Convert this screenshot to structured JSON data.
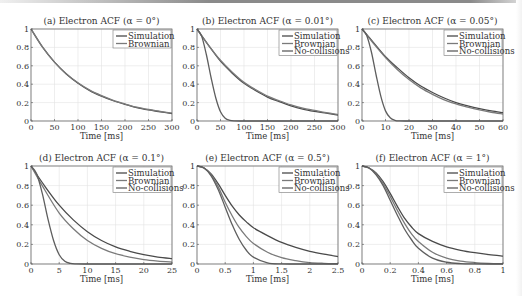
{
  "chart_data": [
    {
      "type": "line",
      "title": "(a) Electron ACF (α = 0°)",
      "xlabel": "Time [ms]",
      "ylabel": "",
      "xlim": [
        0,
        300
      ],
      "ylim": [
        0,
        1
      ],
      "xticks": [
        0,
        50,
        100,
        150,
        200,
        250,
        300
      ],
      "yticks": [
        0,
        0.2,
        0.4,
        0.6,
        0.8,
        1
      ],
      "grid": true,
      "legend_position": "upper right",
      "series": [
        {
          "name": "Simulation",
          "x": [
            0,
            25,
            50,
            75,
            100,
            125,
            150,
            175,
            200,
            225,
            250,
            275,
            300
          ],
          "y": [
            1,
            0.8,
            0.64,
            0.51,
            0.41,
            0.33,
            0.27,
            0.22,
            0.18,
            0.145,
            0.12,
            0.1,
            0.08
          ]
        },
        {
          "name": "Brownian",
          "x": [
            0,
            25,
            50,
            75,
            100,
            125,
            150,
            175,
            200,
            225,
            250,
            275,
            300
          ],
          "y": [
            1,
            0.8,
            0.64,
            0.515,
            0.415,
            0.335,
            0.275,
            0.225,
            0.185,
            0.15,
            0.125,
            0.105,
            0.085
          ]
        }
      ]
    },
    {
      "type": "line",
      "title": "(b) Electron ACF (α = 0.01°)",
      "xlabel": "Time [ms]",
      "ylabel": "",
      "xlim": [
        0,
        300
      ],
      "ylim": [
        0,
        1
      ],
      "xticks": [
        0,
        50,
        100,
        150,
        200,
        250,
        300
      ],
      "yticks": [
        0,
        0.2,
        0.4,
        0.6,
        0.8,
        1
      ],
      "grid": true,
      "legend_position": "upper right",
      "series": [
        {
          "name": "Simulation",
          "x": [
            0,
            25,
            50,
            75,
            100,
            125,
            150,
            175,
            200,
            225,
            250,
            275,
            300
          ],
          "y": [
            1,
            0.82,
            0.65,
            0.52,
            0.41,
            0.33,
            0.26,
            0.21,
            0.165,
            0.13,
            0.105,
            0.085,
            0.065
          ]
        },
        {
          "name": "Brownian",
          "x": [
            0,
            25,
            50,
            75,
            100,
            125,
            150,
            175,
            200,
            225,
            250,
            275,
            300
          ],
          "y": [
            1,
            0.82,
            0.66,
            0.53,
            0.42,
            0.34,
            0.27,
            0.22,
            0.175,
            0.14,
            0.115,
            0.09,
            0.07
          ]
        },
        {
          "name": "No-collisions",
          "x": [
            0,
            10,
            20,
            30,
            40,
            50,
            60,
            70,
            80,
            100,
            150,
            200,
            300
          ],
          "y": [
            1,
            0.92,
            0.72,
            0.47,
            0.25,
            0.1,
            0.03,
            0.007,
            0.001,
            0,
            0,
            0,
            0
          ]
        }
      ]
    },
    {
      "type": "line",
      "title": "(c) Electron ACF (α = 0.05°)",
      "xlabel": "Time [ms]",
      "ylabel": "",
      "xlim": [
        0,
        60
      ],
      "ylim": [
        0,
        1
      ],
      "xticks": [
        0,
        10,
        20,
        30,
        40,
        50,
        60
      ],
      "yticks": [
        0,
        0.2,
        0.4,
        0.6,
        0.8,
        1
      ],
      "grid": true,
      "legend_position": "upper right",
      "series": [
        {
          "name": "Simulation",
          "x": [
            0,
            5,
            10,
            15,
            20,
            25,
            30,
            35,
            40,
            45,
            50,
            55,
            60
          ],
          "y": [
            1,
            0.85,
            0.7,
            0.58,
            0.47,
            0.38,
            0.31,
            0.25,
            0.2,
            0.165,
            0.135,
            0.11,
            0.09
          ]
        },
        {
          "name": "Brownian",
          "x": [
            0,
            5,
            10,
            15,
            20,
            25,
            30,
            35,
            40,
            45,
            50,
            55,
            60
          ],
          "y": [
            1,
            0.84,
            0.69,
            0.56,
            0.45,
            0.36,
            0.29,
            0.23,
            0.185,
            0.15,
            0.12,
            0.095,
            0.075
          ]
        },
        {
          "name": "No-collisions",
          "x": [
            0,
            2,
            4,
            6,
            8,
            10,
            12,
            14,
            16,
            20,
            30,
            40,
            60
          ],
          "y": [
            1,
            0.93,
            0.75,
            0.5,
            0.27,
            0.11,
            0.035,
            0.008,
            0.001,
            0,
            0,
            0,
            0
          ]
        }
      ]
    },
    {
      "type": "line",
      "title": "(d) Electron ACF (α = 0.1°)",
      "xlabel": "Time [ms]",
      "ylabel": "",
      "xlim": [
        0,
        25
      ],
      "ylim": [
        0,
        1
      ],
      "xticks": [
        0,
        5,
        10,
        15,
        20,
        25
      ],
      "yticks": [
        0,
        0.2,
        0.4,
        0.6,
        0.8,
        1
      ],
      "grid": true,
      "legend_position": "upper right",
      "series": [
        {
          "name": "Simulation",
          "x": [
            0,
            2.5,
            5,
            7.5,
            10,
            12.5,
            15,
            17.5,
            20,
            22.5,
            25
          ],
          "y": [
            1,
            0.79,
            0.6,
            0.45,
            0.33,
            0.24,
            0.175,
            0.13,
            0.095,
            0.07,
            0.055
          ]
        },
        {
          "name": "Brownian",
          "x": [
            0,
            2.5,
            5,
            7.5,
            10,
            12.5,
            15,
            17.5,
            20,
            22.5,
            25
          ],
          "y": [
            1,
            0.75,
            0.52,
            0.36,
            0.24,
            0.16,
            0.105,
            0.07,
            0.045,
            0.03,
            0.02
          ]
        },
        {
          "name": "No-collisions",
          "x": [
            0,
            1,
            2,
            3,
            4,
            5,
            6,
            7,
            8,
            10,
            15,
            20,
            25
          ],
          "y": [
            1,
            0.92,
            0.72,
            0.46,
            0.24,
            0.095,
            0.028,
            0.006,
            0.001,
            0,
            0,
            0,
            0
          ]
        }
      ]
    },
    {
      "type": "line",
      "title": "(e) Electron ACF (α = 0.5°)",
      "xlabel": "Time [ms]",
      "ylabel": "",
      "xlim": [
        0,
        2.5
      ],
      "ylim": [
        0,
        1
      ],
      "xticks": [
        0,
        0.5,
        1,
        1.5,
        2,
        2.5
      ],
      "yticks": [
        0,
        0.2,
        0.4,
        0.6,
        0.8,
        1
      ],
      "grid": true,
      "legend_position": "upper right",
      "series": [
        {
          "name": "Simulation",
          "x": [
            0,
            0.125,
            0.25,
            0.375,
            0.5,
            0.625,
            0.75,
            0.875,
            1,
            1.25,
            1.5,
            1.75,
            2,
            2.25,
            2.5
          ],
          "y": [
            1,
            0.98,
            0.92,
            0.82,
            0.7,
            0.59,
            0.5,
            0.43,
            0.37,
            0.29,
            0.22,
            0.17,
            0.13,
            0.1,
            0.075
          ]
        },
        {
          "name": "Brownian",
          "x": [
            0,
            0.125,
            0.25,
            0.375,
            0.5,
            0.625,
            0.75,
            0.875,
            1,
            1.25,
            1.5,
            1.75,
            2,
            2.25,
            2.5
          ],
          "y": [
            1,
            0.98,
            0.91,
            0.79,
            0.63,
            0.49,
            0.37,
            0.28,
            0.21,
            0.12,
            0.065,
            0.035,
            0.015,
            0.007,
            0.003
          ]
        },
        {
          "name": "No-collisions",
          "x": [
            0,
            0.125,
            0.25,
            0.375,
            0.5,
            0.625,
            0.75,
            0.875,
            1,
            1.25,
            1.5,
            1.75,
            2,
            2.5
          ],
          "y": [
            1,
            0.98,
            0.9,
            0.76,
            0.58,
            0.4,
            0.25,
            0.14,
            0.07,
            0.012,
            0.001,
            0,
            0,
            0
          ]
        }
      ]
    },
    {
      "type": "line",
      "title": "(f) Electron ACF (α = 1°)",
      "xlabel": "Time [ms]",
      "ylabel": "",
      "xlim": [
        0,
        1
      ],
      "ylim": [
        0,
        1
      ],
      "xticks": [
        0,
        0.2,
        0.4,
        0.6,
        0.8,
        1
      ],
      "yticks": [
        0,
        0.2,
        0.4,
        0.6,
        0.8,
        1
      ],
      "grid": true,
      "legend_position": "upper right",
      "series": [
        {
          "name": "Simulation",
          "x": [
            0,
            0.05,
            0.1,
            0.15,
            0.2,
            0.25,
            0.3,
            0.35,
            0.4,
            0.5,
            0.6,
            0.7,
            0.8,
            0.9,
            1
          ],
          "y": [
            1,
            0.98,
            0.93,
            0.84,
            0.72,
            0.59,
            0.47,
            0.38,
            0.31,
            0.23,
            0.175,
            0.14,
            0.115,
            0.095,
            0.08
          ]
        },
        {
          "name": "Brownian",
          "x": [
            0,
            0.05,
            0.1,
            0.15,
            0.2,
            0.25,
            0.3,
            0.35,
            0.4,
            0.5,
            0.6,
            0.7,
            0.8,
            0.9,
            1
          ],
          "y": [
            1,
            0.98,
            0.92,
            0.82,
            0.69,
            0.55,
            0.42,
            0.31,
            0.23,
            0.12,
            0.06,
            0.03,
            0.015,
            0.007,
            0.003
          ]
        },
        {
          "name": "No-collisions",
          "x": [
            0,
            0.05,
            0.1,
            0.15,
            0.2,
            0.25,
            0.3,
            0.35,
            0.4,
            0.5,
            0.6,
            0.7,
            0.8,
            0.9,
            1
          ],
          "y": [
            1,
            0.98,
            0.91,
            0.8,
            0.65,
            0.5,
            0.36,
            0.25,
            0.16,
            0.06,
            0.018,
            0.004,
            0.001,
            0,
            0
          ]
        }
      ]
    }
  ],
  "colors": {
    "Simulation": "#4a4a4a",
    "Brownian": "#7a7a7a",
    "No-collisions": "#5e5e5e",
    "grid": "#e2e2e2",
    "axes": "#555555"
  },
  "layout": {
    "panels": [
      {
        "left": 31,
        "top": 29,
        "width": 141,
        "height": 92
      },
      {
        "left": 197,
        "top": 29,
        "width": 141,
        "height": 92
      },
      {
        "left": 362,
        "top": 29,
        "width": 141,
        "height": 92
      },
      {
        "left": 31,
        "top": 166,
        "width": 141,
        "height": 98
      },
      {
        "left": 197,
        "top": 166,
        "width": 141,
        "height": 98
      },
      {
        "left": 362,
        "top": 166,
        "width": 141,
        "height": 98
      }
    ]
  }
}
